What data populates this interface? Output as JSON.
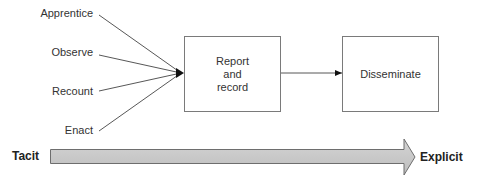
{
  "inputs": [
    {
      "label": "Apprentice"
    },
    {
      "label": "Observe"
    },
    {
      "label": "Recount"
    },
    {
      "label": "Enact"
    }
  ],
  "boxes": [
    {
      "label": "Report\nand\nrecord"
    },
    {
      "label": "Disseminate"
    }
  ],
  "axis": {
    "start_label": "Tacit",
    "end_label": "Explicit",
    "fill_color": "#c8c8c8"
  }
}
